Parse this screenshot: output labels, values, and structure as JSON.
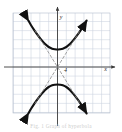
{
  "figure": {
    "title": "",
    "caption": "Fig. 1   Graph of hyperbola"
  },
  "axes": {
    "x_label": "x",
    "y_label": "y",
    "origin_label": "4",
    "vertex_upper_label": "4"
  },
  "colors": {
    "grid": "#c9d2de",
    "grid_major": "#b3bdcc",
    "axis": "#3a3a3a",
    "curve": "#111111",
    "asymptote": "#8a8a8a",
    "background": "#ffffff",
    "caption": "#cdcdcd"
  },
  "chart_data": {
    "type": "line",
    "title": "",
    "subtitle": "",
    "xlabel": "x",
    "ylabel": "y",
    "grid": true,
    "legend_position": "none",
    "xlim": [
      -5.5,
      5.5
    ],
    "ylim": [
      -5.5,
      5.5
    ],
    "xticks": [
      -5,
      -4,
      -3,
      -2,
      -1,
      0,
      1,
      2,
      3,
      4,
      5
    ],
    "yticks": [
      -5,
      -4,
      -3,
      -2,
      -1,
      0,
      1,
      2,
      3,
      4,
      5
    ],
    "tick_labels_shown": false,
    "annotations": [
      {
        "text": "y",
        "x": 0.25,
        "y": 5.3
      },
      {
        "text": "x",
        "x": 5.3,
        "y": -0.45
      },
      {
        "text": "4",
        "x": 0.75,
        "y": -0.6
      }
    ],
    "series": [
      {
        "name": "hyperbola-upper-branch",
        "style": "solid",
        "width": 2.1,
        "arrow_start": true,
        "arrow_end": true,
        "points": [
          {
            "x": -3.3,
            "y": 5.1
          },
          {
            "x": -3.0,
            "y": 4.6
          },
          {
            "x": -2.6,
            "y": 4.0
          },
          {
            "x": -2.2,
            "y": 3.45
          },
          {
            "x": -1.8,
            "y": 2.95
          },
          {
            "x": -1.4,
            "y": 2.52
          },
          {
            "x": -1.0,
            "y": 2.2
          },
          {
            "x": -0.6,
            "y": 2.02
          },
          {
            "x": -0.3,
            "y": 1.95
          },
          {
            "x": 0.0,
            "y": 1.92
          },
          {
            "x": 0.3,
            "y": 1.95
          },
          {
            "x": 0.6,
            "y": 2.02
          },
          {
            "x": 1.0,
            "y": 2.2
          },
          {
            "x": 1.4,
            "y": 2.52
          },
          {
            "x": 1.8,
            "y": 2.95
          },
          {
            "x": 2.2,
            "y": 3.45
          },
          {
            "x": 2.6,
            "y": 4.0
          },
          {
            "x": 3.0,
            "y": 4.6
          },
          {
            "x": 3.3,
            "y": 5.1
          }
        ]
      },
      {
        "name": "hyperbola-lower-branch",
        "style": "solid",
        "width": 2.1,
        "arrow_start": true,
        "arrow_end": true,
        "points": [
          {
            "x": -3.3,
            "y": -5.1
          },
          {
            "x": -3.0,
            "y": -4.6
          },
          {
            "x": -2.6,
            "y": -4.0
          },
          {
            "x": -2.2,
            "y": -3.45
          },
          {
            "x": -1.8,
            "y": -2.95
          },
          {
            "x": -1.4,
            "y": -2.52
          },
          {
            "x": -1.0,
            "y": -2.2
          },
          {
            "x": -0.6,
            "y": -2.02
          },
          {
            "x": -0.3,
            "y": -1.95
          },
          {
            "x": 0.0,
            "y": -1.92
          },
          {
            "x": 0.3,
            "y": -1.95
          },
          {
            "x": 0.6,
            "y": -2.02
          },
          {
            "x": 1.0,
            "y": -2.2
          },
          {
            "x": 1.4,
            "y": -2.52
          },
          {
            "x": 1.8,
            "y": -2.95
          },
          {
            "x": 2.2,
            "y": -3.45
          },
          {
            "x": 2.6,
            "y": -4.0
          },
          {
            "x": 3.0,
            "y": -4.6
          },
          {
            "x": 3.3,
            "y": -5.1
          }
        ]
      },
      {
        "name": "asymptote-positive-slope",
        "style": "dashed",
        "width": 0.8,
        "points": [
          {
            "x": -2.55,
            "y": -4.0
          },
          {
            "x": 2.55,
            "y": 4.0
          }
        ]
      },
      {
        "name": "asymptote-negative-slope",
        "style": "dashed",
        "width": 0.8,
        "points": [
          {
            "x": -2.55,
            "y": 4.0
          },
          {
            "x": 2.55,
            "y": -4.0
          }
        ]
      }
    ]
  }
}
